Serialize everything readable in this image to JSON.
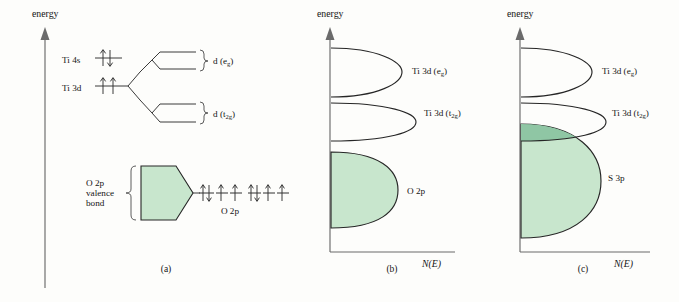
{
  "figure": {
    "background_color": "#fdfdfb",
    "band_fill_color": "#c8e6cd",
    "band_overlap_color": "#8fc6a4",
    "band_stroke_color": "#262626",
    "axis_color": "#6b6b6b"
  },
  "axis_labels": {
    "energy": "energy",
    "density_of_states": "N(E)"
  },
  "panels": [
    {
      "id": "a",
      "caption": "(a)",
      "type": "molecular-orbital-level-diagram",
      "atomic_levels": [
        {
          "label": "Ti 4s",
          "electrons": [
            "up-down"
          ]
        },
        {
          "label": "Ti 3d",
          "electrons": [
            "up",
            "up"
          ]
        }
      ],
      "band_labels": [
        {
          "text": "d (e",
          "sub": "g",
          "tail": ")"
        },
        {
          "text": "d (t",
          "sub": "2g",
          "tail": ")"
        }
      ],
      "valence_band": {
        "brace_label_lines": [
          "O 2p",
          "valence",
          "bond"
        ],
        "fill": "#c8e6cd"
      },
      "ligand_orbitals": {
        "label": "O 2p",
        "groups": [
          {
            "electrons": [
              "up-down",
              "up",
              "up"
            ]
          },
          {
            "electrons": [
              "up-down",
              "up",
              "up"
            ]
          }
        ]
      }
    },
    {
      "id": "b",
      "caption": "(b)",
      "type": "density-of-states",
      "bands": [
        {
          "name": "Ti 3d (e_g)",
          "label_text": "Ti 3d (e",
          "label_sub": "g",
          "label_tail": ")",
          "filled": false,
          "energy_top": 48,
          "energy_bottom": 97,
          "peak_width": 70
        },
        {
          "name": "Ti 3d (t_2g)",
          "label_text": "Ti 3d (t",
          "label_sub": "2g",
          "label_tail": ")",
          "filled": false,
          "energy_top": 103,
          "energy_bottom": 141,
          "peak_width": 84
        },
        {
          "name": "O 2p",
          "label_text": "O 2p",
          "label_sub": "",
          "label_tail": "",
          "filled": true,
          "energy_top": 152,
          "energy_bottom": 228,
          "peak_width": 66
        }
      ]
    },
    {
      "id": "c",
      "caption": "(c)",
      "type": "density-of-states",
      "bands": [
        {
          "name": "Ti 3d (e_g)",
          "label_text": "Ti 3d (e",
          "label_sub": "g",
          "label_tail": ")",
          "filled": false,
          "energy_top": 48,
          "energy_bottom": 97,
          "peak_width": 70
        },
        {
          "name": "Ti 3d (t_2g)",
          "label_text": "Ti 3d (t",
          "label_sub": "2g",
          "label_tail": ")",
          "filled": false,
          "energy_top": 103,
          "energy_bottom": 141,
          "peak_width": 84
        },
        {
          "name": "S 3p",
          "label_text": "S 3p",
          "label_sub": "",
          "label_tail": "",
          "filled": true,
          "energy_top": 124,
          "energy_bottom": 238,
          "peak_width": 80
        }
      ],
      "note": "S 3p band overlaps the Ti 3d (t2g) band"
    }
  ]
}
